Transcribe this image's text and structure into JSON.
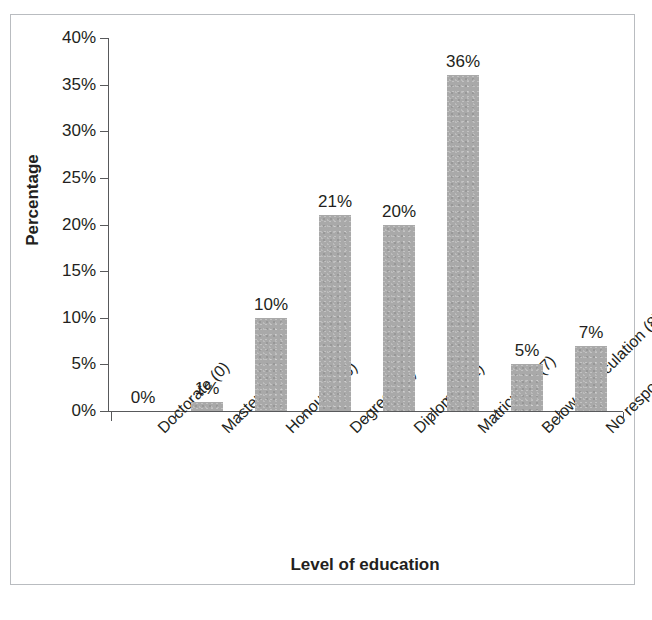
{
  "chart_data": {
    "type": "bar",
    "title": "",
    "xlabel": "Level of education",
    "ylabel": "Percentage",
    "categories": [
      "Doctorate (0)",
      "Masters (2)",
      "Honours (16)",
      "Degree (34)",
      "Diploma (32)",
      "Matriculant (7)",
      "Below matriculation (8)",
      "No response (12)"
    ],
    "values": [
      0,
      1,
      10,
      21,
      20,
      36,
      5,
      7
    ],
    "value_labels": [
      "0%",
      "1%",
      "10%",
      "21%",
      "20%",
      "36%",
      "5%",
      "7%"
    ],
    "counts": [
      0,
      2,
      16,
      34,
      32,
      7,
      8,
      12
    ],
    "ylim": [
      0,
      40
    ],
    "ytick_values": [
      0,
      5,
      10,
      15,
      20,
      25,
      30,
      35,
      40
    ],
    "ytick_labels": [
      "0%",
      "5%",
      "10%",
      "15%",
      "20%",
      "25%",
      "30%",
      "35%",
      "40%"
    ],
    "grid": false,
    "legend": false,
    "legend_position": "none",
    "bar_color": "#a9a9a9",
    "axis_color": "#58595b",
    "text_color": "#231f20"
  },
  "figure": {
    "caption": "",
    "border_color": "#b9bcc0"
  }
}
